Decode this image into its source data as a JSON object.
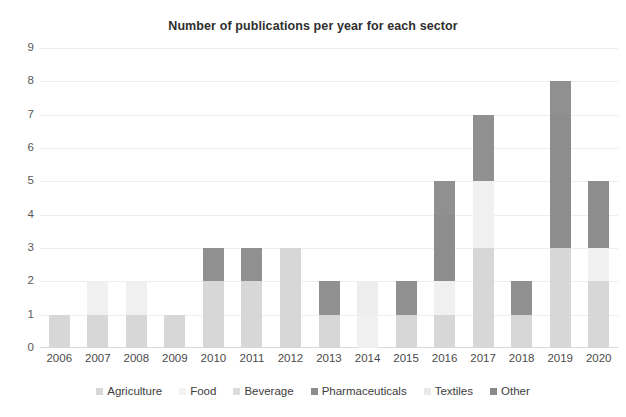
{
  "chart_data": {
    "type": "bar",
    "stacked": true,
    "title": "Number of publications per year for each sector",
    "xlabel": "",
    "ylabel": "",
    "categories": [
      "2006",
      "2007",
      "2008",
      "2009",
      "2010",
      "2011",
      "2012",
      "2013",
      "2014",
      "2015",
      "2016",
      "2017",
      "2018",
      "2019",
      "2020"
    ],
    "ylim": [
      0,
      9
    ],
    "yticks": [
      "0",
      "1",
      "2",
      "3",
      "4",
      "5",
      "6",
      "7",
      "8",
      "9"
    ],
    "grid": true,
    "legend_position": "bottom",
    "series": [
      {
        "name": "Agriculture",
        "color": "#d7d7d7",
        "values": [
          1,
          1,
          1,
          1,
          2,
          2,
          3,
          1,
          0,
          1,
          1,
          3,
          1,
          3,
          2
        ]
      },
      {
        "name": "Food",
        "color": "#f0f0f0",
        "values": [
          0,
          1,
          1,
          0,
          0,
          0,
          0,
          0,
          1,
          0,
          1,
          2,
          0,
          0,
          1
        ]
      },
      {
        "name": "Beverage",
        "color": "#e4e4e4",
        "values": [
          0,
          0,
          0,
          0,
          0,
          0,
          0,
          0,
          0,
          0,
          0,
          0,
          0,
          0,
          0
        ]
      },
      {
        "name": "Pharmaceuticals",
        "color": "#8d8d8d",
        "values": [
          0,
          0,
          0,
          0,
          0,
          0,
          0,
          0,
          0,
          0,
          2,
          0,
          0,
          4,
          2
        ]
      },
      {
        "name": "Textiles",
        "color": "#ededed",
        "values": [
          0,
          0,
          0,
          0,
          0,
          0,
          0,
          0,
          1,
          0,
          0,
          0,
          0,
          0,
          0
        ]
      },
      {
        "name": "Other",
        "color": "#909090",
        "values": [
          0,
          0,
          0,
          0,
          1,
          1,
          0,
          1,
          0,
          1,
          1,
          2,
          1,
          1,
          0
        ]
      }
    ],
    "totals": [
      1,
      2,
      2,
      1,
      3,
      3,
      3,
      2,
      2,
      2,
      5,
      7,
      2,
      8,
      5
    ],
    "annotations": []
  },
  "legend": {
    "items": [
      {
        "label": "Agriculture",
        "color": "#d7d7d7"
      },
      {
        "label": "Food",
        "color": "#f2f2f2"
      },
      {
        "label": "Beverage",
        "color": "#dcdcdc"
      },
      {
        "label": "Pharmaceuticals",
        "color": "#8d8d8d"
      },
      {
        "label": "Textiles",
        "color": "#e8e8e8"
      },
      {
        "label": "Other",
        "color": "#8a8a8a"
      }
    ]
  }
}
